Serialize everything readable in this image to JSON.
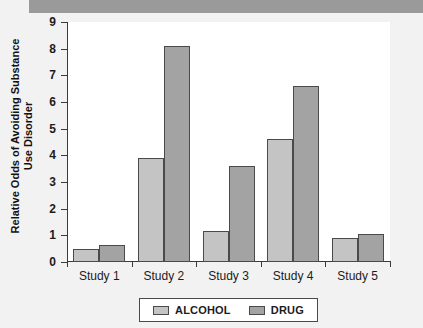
{
  "chart_data": {
    "type": "bar",
    "title": "",
    "xlabel": "",
    "ylabel": "Relative Odds of Avoiding Substance Use Disorder",
    "categories": [
      "Study 1",
      "Study 2",
      "Study 3",
      "Study 4",
      "Study 5"
    ],
    "series": [
      {
        "name": "ALCOHOL",
        "color": "#c4c4c4",
        "values": [
          0.5,
          3.9,
          1.15,
          4.6,
          0.9
        ]
      },
      {
        "name": "DRUG",
        "color": "#a3a3a3",
        "values": [
          0.65,
          8.1,
          3.6,
          6.6,
          1.05
        ]
      }
    ],
    "ylim": [
      0,
      9
    ],
    "yticks": [
      "0",
      "1",
      "2",
      "3",
      "4",
      "5",
      "6",
      "7",
      "8",
      "9"
    ],
    "grid": false,
    "legend_position": "bottom"
  }
}
